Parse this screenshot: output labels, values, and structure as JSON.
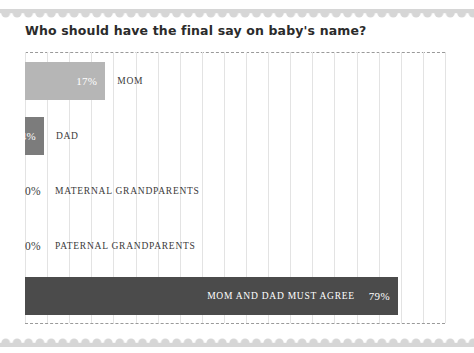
{
  "chart_data": {
    "type": "bar",
    "orientation": "horizontal",
    "title": "Who should have the final say on baby's name?",
    "xlabel": "",
    "ylabel": "",
    "xlim": [
      0,
      100
    ],
    "grid": true,
    "legend": false,
    "categories": [
      "MOM",
      "DAD",
      "MATERNAL GRANDPARENTS",
      "PATERNAL GRANDPARENTS",
      "MOM AND DAD MUST AGREE"
    ],
    "values": [
      17,
      4,
      0,
      0,
      79
    ],
    "value_labels": [
      "17%",
      "4%",
      "0%",
      "0%",
      "79%"
    ],
    "bar_colors": [
      "#b6b6b6",
      "#7c7c7c",
      "#b6b6b6",
      "#b6b6b6",
      "#4b4b4b"
    ],
    "label_placement": [
      "outside",
      "outside",
      "outside",
      "outside",
      "inside"
    ],
    "value_placement": [
      "inside",
      "inside",
      "outside",
      "outside",
      "inside"
    ]
  },
  "colors": {
    "bar_light": "#b6b6b6",
    "bar_mid": "#7c7c7c",
    "bar_dark": "#4b4b4b",
    "gridline": "#e3e3e3",
    "plot_border": "#9a9a9a",
    "scallop": "#d6d6d6",
    "title_text": "#2b2b2b",
    "label_text": "#3a3a3a",
    "value_text_inverse": "#ffffff",
    "background": "#ffffff"
  }
}
